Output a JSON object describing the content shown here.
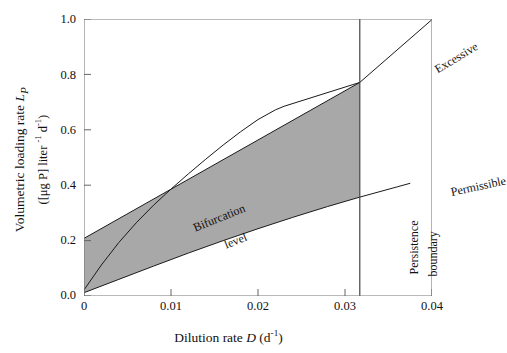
{
  "chart_data": {
    "type": "line",
    "title": "",
    "xlabel": "Dilution rate D (d-1)",
    "ylabel_line1": "Volumetric loading rate LP",
    "ylabel_line2": "([μg P] liter -1 d-1)",
    "xlim": [
      0,
      0.04
    ],
    "ylim": [
      0,
      1.0
    ],
    "xticks": [
      "0",
      "0.01",
      "0.02",
      "0.03",
      "0.04"
    ],
    "xtick_values": [
      0,
      0.01,
      0.02,
      0.03,
      0.04
    ],
    "yticks": [
      "0.0",
      "0.2",
      "0.4",
      "0.6",
      "0.8",
      "1.0"
    ],
    "ytick_values": [
      0.0,
      0.2,
      0.4,
      0.6,
      0.8,
      1.0
    ],
    "grid": false,
    "legend": "none",
    "shaded_region": {
      "label": "coexistence region",
      "color": "#a8a8a8",
      "opacity": 1,
      "right_bound_x": 0.0317
    },
    "series": [
      {
        "name": "Excessive",
        "style": "straight line",
        "points": [
          [
            0,
            0.208
          ],
          [
            0.0317,
            0.771
          ],
          [
            0.04,
            0.998
          ]
        ]
      },
      {
        "name": "Permissible",
        "style": "gently curved line",
        "points": [
          [
            0,
            0.012
          ],
          [
            0.004,
            0.06
          ],
          [
            0.008,
            0.108
          ],
          [
            0.012,
            0.155
          ],
          [
            0.016,
            0.2
          ],
          [
            0.02,
            0.243
          ],
          [
            0.024,
            0.284
          ],
          [
            0.028,
            0.323
          ],
          [
            0.0317,
            0.357
          ],
          [
            0.036,
            0.394
          ],
          [
            0.0375,
            0.407
          ]
        ]
      },
      {
        "name": "Bifurcation level",
        "style": "concave curve merging tangentially into the Excessive line",
        "points": [
          [
            0,
            0.022
          ],
          [
            0.002,
            0.112
          ],
          [
            0.004,
            0.193
          ],
          [
            0.006,
            0.264
          ],
          [
            0.008,
            0.328
          ],
          [
            0.01,
            0.386
          ],
          [
            0.012,
            0.441
          ],
          [
            0.014,
            0.494
          ],
          [
            0.016,
            0.545
          ],
          [
            0.018,
            0.593
          ],
          [
            0.02,
            0.637
          ],
          [
            0.022,
            0.672
          ],
          [
            0.023,
            0.685
          ],
          [
            0.0317,
            0.771
          ]
        ]
      },
      {
        "name": "Persistence boundary",
        "style": "vertical line",
        "points": [
          [
            0.0317,
            0.0
          ],
          [
            0.0317,
            1.0
          ]
        ]
      }
    ],
    "annotations": [
      {
        "text": "Excessive",
        "x": 0.0345,
        "y": 0.915,
        "rotation": -31
      },
      {
        "text": "Permissible",
        "x": 0.0372,
        "y": 0.465,
        "rotation": -12
      },
      {
        "text": "Bifurcation",
        "x": 0.0035,
        "y": 0.315,
        "rotation": -22
      },
      {
        "text": "level",
        "x": 0.0073,
        "y": 0.258,
        "rotation": -22
      },
      {
        "text": "Persistence",
        "x": 0.03,
        "y": 0.115,
        "rotation": -90
      },
      {
        "text": "boundary",
        "x": 0.0322,
        "y": 0.11,
        "rotation": -90
      }
    ]
  },
  "axes": {
    "y_title_line1_pre": "Volumetric loading rate ",
    "y_title_line1_var": "L",
    "y_title_line1_sub": "P",
    "y_title_line2_pre": "([μg P] liter ",
    "y_title_line2_sup1": "-1",
    "y_title_line2_mid": " d",
    "y_title_line2_sup2": "-1",
    "y_title_line2_post": ")",
    "x_title_pre": "Dilution rate ",
    "x_title_var": "D",
    "x_title_mid": " (d",
    "x_title_sup": "-1",
    "x_title_post": ")"
  },
  "ticks": {
    "y": [
      {
        "label": "1.0",
        "top": 12
      },
      {
        "label": "0.8",
        "top": 68
      },
      {
        "label": "0.6",
        "top": 123
      },
      {
        "label": "0.4",
        "top": 178
      },
      {
        "label": "0.2",
        "top": 233
      },
      {
        "label": "0.0",
        "top": 288
      }
    ],
    "x": [
      {
        "label": "0",
        "left": 59
      },
      {
        "left": 146,
        "label": "0.01"
      },
      {
        "left": 233,
        "label": "0.02"
      },
      {
        "left": 320,
        "label": "0.03"
      },
      {
        "left": 407,
        "label": "0.04"
      }
    ]
  },
  "annotations": {
    "excessive": "Excessive",
    "permissible": "Permissible",
    "bifurcation": "Bifurcation",
    "level": "level",
    "persistence": "Persistence",
    "boundary": "boundary"
  },
  "colors": {
    "shade": "#a8a8a8",
    "line": "#1a1a1a",
    "axis": "#555555"
  }
}
